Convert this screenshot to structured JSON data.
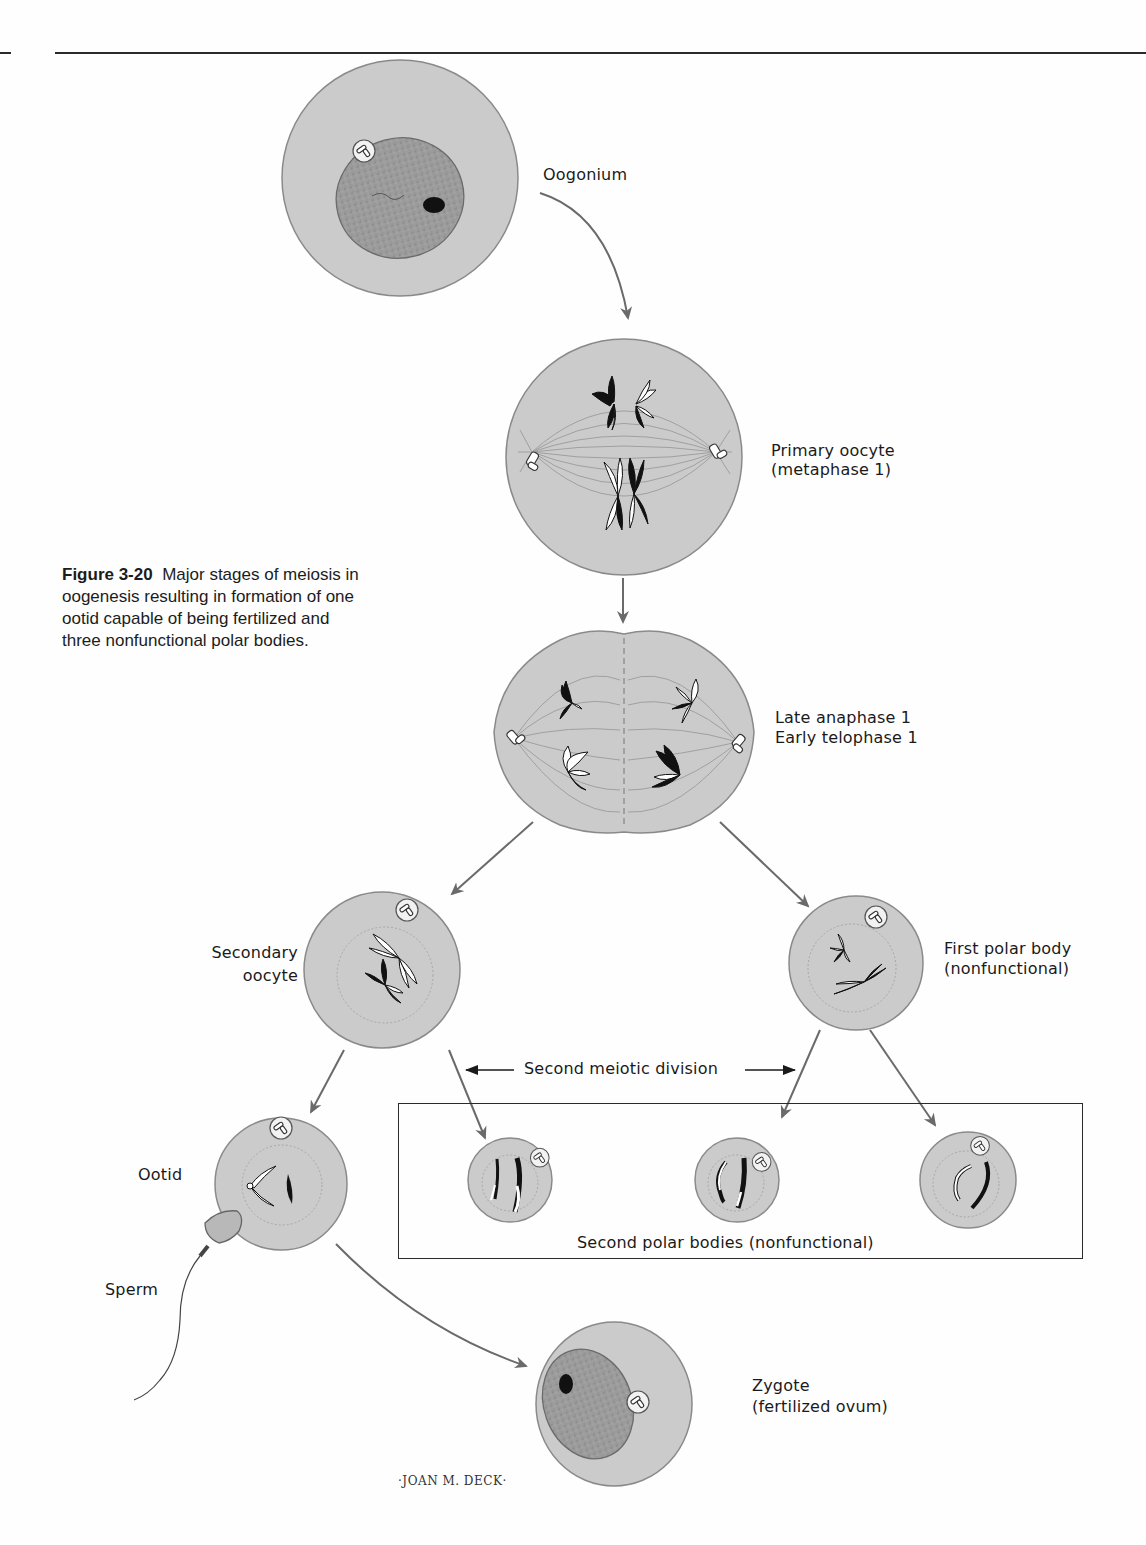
{
  "figure": {
    "number": "Figure 3-20",
    "caption_lines": [
      "Major stages of meiosis in",
      "oogenesis resulting in formation of one",
      "ootid capable of being fertilized and",
      "three nonfunctional polar bodies."
    ]
  },
  "stages": {
    "oogonium": {
      "label": "Oogonium"
    },
    "primary_oocyte": {
      "line1": "Primary oocyte",
      "line2": "(metaphase 1)"
    },
    "anaphase": {
      "line1": "Late anaphase 1",
      "line2": "Early telophase 1"
    },
    "secondary_oocyte": {
      "line1": "Secondary",
      "line2": "oocyte"
    },
    "first_polar_body": {
      "line1": "First polar body",
      "line2": "(nonfunctional)"
    },
    "second_meiotic_division": {
      "label": "Second meiotic division"
    },
    "ootid": {
      "label": "Ootid"
    },
    "sperm": {
      "label": "Sperm"
    },
    "second_polar_bodies": {
      "label": "Second polar bodies (nonfunctional)"
    },
    "zygote": {
      "line1": "Zygote",
      "line2": "(fertilized ovum)"
    }
  },
  "credit": {
    "artist": "·JOAN M. DECK·"
  },
  "colors": {
    "cell_fill": "#c9c9c9",
    "cell_stroke": "#8a8a8a",
    "nucleus_fill": "#9a9a9a",
    "arrow": "#6a6a6a",
    "text": "#1a1a1a"
  }
}
